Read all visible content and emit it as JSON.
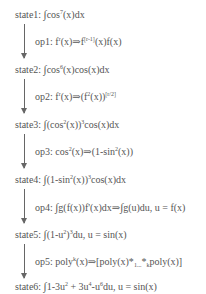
{
  "diagram": {
    "type": "derivation-flow",
    "states": [
      {
        "label": "state1:",
        "expr": "∫cos⁷(x)dx"
      },
      {
        "label": "state2:",
        "expr": "∫cos⁶(x)cos(x)dx"
      },
      {
        "label": "state3:",
        "expr": "∫(cos²(x))³cos(x)dx"
      },
      {
        "label": "state4:",
        "expr": "∫(1-sin²(x))³cos(x)dx"
      },
      {
        "label": "state5:",
        "expr": "∫(1-u²)³du, u = sin(x)"
      },
      {
        "label": "state6:",
        "expr": "∫1-3u² + 3u⁴-u⁶du, u = sin(x)"
      }
    ],
    "ops": [
      {
        "label": "op1:",
        "expr": "fʳ(x)⇒f[r-1](x)f(x)"
      },
      {
        "label": "op2:",
        "expr": "fʳ(x)⇒(f²(x))[r/2]"
      },
      {
        "label": "op3:",
        "expr": "cos²(x)⇒(1-sin²(x))"
      },
      {
        "label": "op4:",
        "expr": "∫g(f(x))f'(x)dx⇒∫g(u)du, u = f(x)"
      },
      {
        "label": "op5:",
        "expr": "polyᵏ(x)⇒[poly(x)*₁...*ₖpoly(x)]"
      }
    ],
    "edges": [
      {
        "from": "state1",
        "to": "state2",
        "via": "op1"
      },
      {
        "from": "state2",
        "to": "state3",
        "via": "op2"
      },
      {
        "from": "state3",
        "to": "state4",
        "via": "op3"
      },
      {
        "from": "state4",
        "to": "state5",
        "via": "op4"
      },
      {
        "from": "state5",
        "to": "state6",
        "via": "op5"
      }
    ],
    "colors": {
      "text": "#555555",
      "arrow": "#666666",
      "background": "#ffffff"
    }
  },
  "text": {
    "s1": {
      "label": "state1:",
      "int": "∫",
      "a": "cos",
      "sup": "7",
      "b": "(x)dx"
    },
    "o1": {
      "label": "op1:",
      "a": "f",
      "sup1": "r",
      "b": "(x)⇒f",
      "sup2": "[r-1]",
      "c": "(x)f(x)"
    },
    "s2": {
      "label": "state2:",
      "int": "∫",
      "a": "cos",
      "sup": "6",
      "b": "(x)cos(x)dx"
    },
    "o2": {
      "label": "op2:",
      "a": "f",
      "sup1": "r",
      "b": "(x)⇒(f",
      "sup2": "2",
      "c": "(x))",
      "sup3": "[r/2]"
    },
    "s3": {
      "label": "state3:",
      "int": "∫",
      "a": "(cos",
      "sup1": "2",
      "b": "(x))",
      "sup2": "3",
      "c": "cos(x)dx"
    },
    "o3": {
      "label": "op3:",
      "a": "cos",
      "sup1": "2",
      "b": "(x)⇒(1-sin",
      "sup2": "2",
      "c": "(x))"
    },
    "s4": {
      "label": "state4:",
      "int": "∫",
      "a": "(1-sin",
      "sup1": "2",
      "b": "(x))",
      "sup2": "3",
      "c": "cos(x)dx"
    },
    "o4": {
      "label": "op4:",
      "int1": "∫",
      "a": "g(f(x))f'(x)dx⇒",
      "int2": "∫",
      "b": "g(u)du, u = f(x)"
    },
    "s5": {
      "label": "state5:",
      "int": "∫",
      "a": "(1-u",
      "sup1": "2",
      "b": ")",
      "sup2": "3",
      "c": "du, u = sin(x)"
    },
    "o5": {
      "label": "op5:",
      "a": "poly",
      "sup1": "k",
      "b": "(x)⇒[poly(x)*",
      "sub1": "1...",
      "c": "*",
      "sub2": "k",
      "d": "poly(x)]"
    },
    "s6": {
      "label": "state6:",
      "int": "∫",
      "a": "1-3u",
      "sup1": "2",
      "b": " + 3u",
      "sup2": "4",
      "c": "-u",
      "sup3": "6",
      "d": "du, u = sin(x)"
    }
  }
}
